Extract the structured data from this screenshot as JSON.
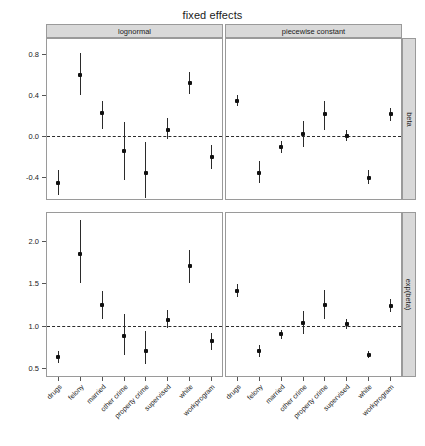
{
  "chart_data": {
    "type": "scatter",
    "title": "fixed effects",
    "xlabel": "",
    "ylabel": "",
    "grid": false,
    "legend": false,
    "reference_lines": {
      "beta": 0.0,
      "exp(beta)": 1.0
    },
    "col_facets": [
      "lognormal",
      "piecewise constant"
    ],
    "row_facets": [
      "beta",
      "exp(beta)"
    ],
    "categories": [
      "drugs",
      "felony",
      "married",
      "other crime",
      "property crime",
      "supervised",
      "white",
      "workprogram"
    ],
    "panels": [
      {
        "row": "beta",
        "col": "lognormal",
        "ylim": [
          -0.62,
          0.95
        ],
        "yticks": [
          0.8,
          0.4,
          0.0,
          -0.4
        ],
        "ytick_labels": [
          "0.8",
          "0.4",
          "0.0",
          "-0.4"
        ],
        "points": [
          {
            "x": "drugs",
            "y": -0.46,
            "lo": -0.58,
            "hi": -0.34
          },
          {
            "x": "felony",
            "y": 0.6,
            "lo": 0.4,
            "hi": 0.81
          },
          {
            "x": "married",
            "y": 0.22,
            "lo": 0.07,
            "hi": 0.34
          },
          {
            "x": "other crime",
            "y": -0.15,
            "lo": -0.43,
            "hi": 0.14
          },
          {
            "x": "property crime",
            "y": -0.36,
            "lo": -0.61,
            "hi": -0.06
          },
          {
            "x": "supervised",
            "y": 0.06,
            "lo": -0.03,
            "hi": 0.17
          },
          {
            "x": "white",
            "y": 0.52,
            "lo": 0.41,
            "hi": 0.63
          },
          {
            "x": "workprogram",
            "y": -0.21,
            "lo": -0.33,
            "hi": -0.09
          }
        ]
      },
      {
        "row": "beta",
        "col": "piecewise constant",
        "ylim": [
          -0.62,
          0.95
        ],
        "points": [
          {
            "x": "drugs",
            "y": 0.34,
            "lo": 0.29,
            "hi": 0.4
          },
          {
            "x": "felony",
            "y": -0.36,
            "lo": -0.46,
            "hi": -0.25
          },
          {
            "x": "married",
            "y": -0.11,
            "lo": -0.17,
            "hi": -0.05
          },
          {
            "x": "other crime",
            "y": 0.02,
            "lo": -0.11,
            "hi": 0.15
          },
          {
            "x": "property crime",
            "y": 0.21,
            "lo": 0.06,
            "hi": 0.34
          },
          {
            "x": "supervised",
            "y": 0.0,
            "lo": -0.05,
            "hi": 0.06
          },
          {
            "x": "white",
            "y": -0.41,
            "lo": -0.47,
            "hi": -0.34
          },
          {
            "x": "workprogram",
            "y": 0.21,
            "lo": 0.15,
            "hi": 0.27
          }
        ]
      },
      {
        "row": "exp(beta)",
        "col": "lognormal",
        "ylim": [
          0.41,
          2.33
        ],
        "yticks": [
          2.0,
          1.5,
          1.0,
          0.5
        ],
        "ytick_labels": [
          "2.0",
          "1.5",
          "1.0",
          "0.5"
        ],
        "points": [
          {
            "x": "drugs",
            "y": 0.63,
            "lo": 0.56,
            "hi": 0.71
          },
          {
            "x": "felony",
            "y": 1.85,
            "lo": 1.5,
            "hi": 2.25
          },
          {
            "x": "married",
            "y": 1.25,
            "lo": 1.08,
            "hi": 1.41
          },
          {
            "x": "other crime",
            "y": 0.88,
            "lo": 0.66,
            "hi": 1.14
          },
          {
            "x": "property crime",
            "y": 0.7,
            "lo": 0.55,
            "hi": 0.94
          },
          {
            "x": "supervised",
            "y": 1.07,
            "lo": 0.97,
            "hi": 1.19
          },
          {
            "x": "white",
            "y": 1.7,
            "lo": 1.51,
            "hi": 1.89
          },
          {
            "x": "workprogram",
            "y": 0.82,
            "lo": 0.72,
            "hi": 0.92
          }
        ]
      },
      {
        "row": "exp(beta)",
        "col": "piecewise constant",
        "ylim": [
          0.41,
          2.33
        ],
        "points": [
          {
            "x": "drugs",
            "y": 1.41,
            "lo": 1.34,
            "hi": 1.49
          },
          {
            "x": "felony",
            "y": 0.7,
            "lo": 0.63,
            "hi": 0.78
          },
          {
            "x": "married",
            "y": 0.9,
            "lo": 0.84,
            "hi": 0.95
          },
          {
            "x": "other crime",
            "y": 1.04,
            "lo": 0.9,
            "hi": 1.18
          },
          {
            "x": "property crime",
            "y": 1.25,
            "lo": 1.08,
            "hi": 1.42
          },
          {
            "x": "supervised",
            "y": 1.02,
            "lo": 0.96,
            "hi": 1.08
          },
          {
            "x": "white",
            "y": 0.66,
            "lo": 0.62,
            "hi": 0.7
          },
          {
            "x": "workprogram",
            "y": 1.24,
            "lo": 1.16,
            "hi": 1.32
          }
        ]
      }
    ]
  }
}
